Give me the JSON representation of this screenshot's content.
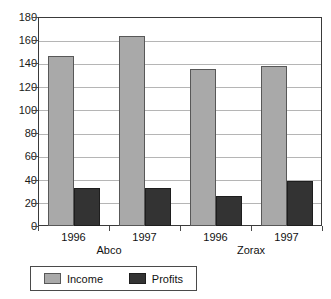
{
  "chart_data": {
    "type": "bar",
    "title": "",
    "subtitle": "",
    "xlabel": "",
    "ylabel": "",
    "ylim": [
      0,
      180
    ],
    "ytick_step": 20,
    "yticks": [
      180,
      160,
      140,
      120,
      100,
      80,
      60,
      40,
      20,
      0
    ],
    "grid": true,
    "legend_position": "bottom",
    "categories": [
      "1996",
      "1997",
      "1996",
      "1997"
    ],
    "group_labels": [
      "Abco",
      "Zorax"
    ],
    "groups": [
      {
        "name": "Abco",
        "years": [
          "1996",
          "1997"
        ],
        "income": [
          146,
          164
        ],
        "profits": [
          33,
          33
        ]
      },
      {
        "name": "Zorax",
        "years": [
          "1996",
          "1997"
        ],
        "income": [
          135,
          138
        ],
        "profits": [
          26,
          39
        ]
      }
    ],
    "series": [
      {
        "name": "Income",
        "color": "#a9a9a9",
        "values": [
          146,
          164,
          135,
          138
        ]
      },
      {
        "name": "Profits",
        "color": "#333333",
        "values": [
          33,
          33,
          26,
          39
        ]
      }
    ]
  },
  "legend": {
    "items": [
      {
        "label": "Income",
        "color": "#a9a9a9"
      },
      {
        "label": "Profits",
        "color": "#333333"
      }
    ]
  },
  "colors": {
    "income": "#a9a9a9",
    "profits": "#333333",
    "axis": "#3a3a3a",
    "grid": "#b5b5b5",
    "background": "#ffffff"
  }
}
